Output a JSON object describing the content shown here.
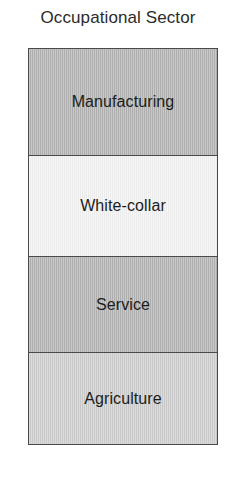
{
  "chart_data": {
    "type": "bar",
    "title": "Occupational Sector",
    "orientation": "vertical-stack",
    "xlabel": "",
    "ylabel": "",
    "categories": [
      "Manufacturing",
      "White-collar",
      "Service",
      "Agriculture"
    ],
    "values": [
      107,
      102,
      96,
      92
    ],
    "value_unit": "pixel-band-height",
    "segments": [
      {
        "label": "Manufacturing",
        "fill": "#b2b2b2",
        "height": 107
      },
      {
        "label": "White-collar",
        "fill": "#f2f2f2",
        "height": 102
      },
      {
        "label": "Service",
        "fill": "#b2b2b2",
        "height": 96
      },
      {
        "label": "Agriculture",
        "fill": "#cdcdcd",
        "height": 92
      }
    ],
    "legend": [],
    "grid": false,
    "border_color": "#4a4a4a",
    "background": "#ffffff"
  },
  "page": {
    "title": "Occupational Sector"
  }
}
